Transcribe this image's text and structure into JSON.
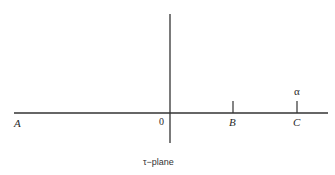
{
  "diagram": {
    "caption": "τ−plane",
    "labels": {
      "A": "A",
      "origin": "0",
      "B": "B",
      "C": "C",
      "alpha": "α"
    },
    "axes": {
      "horizontal": {
        "x1": 14,
        "x2": 328,
        "y": 113
      },
      "vertical": {
        "x": 170,
        "y1": 14,
        "y2": 143
      }
    },
    "ticks": [
      {
        "name": "B",
        "x": 233,
        "y1": 101,
        "y2": 113
      },
      {
        "name": "C",
        "x": 297,
        "y1": 101,
        "y2": 113
      }
    ],
    "colors": {
      "line": "#333333",
      "text": "#2a2a2a"
    }
  }
}
